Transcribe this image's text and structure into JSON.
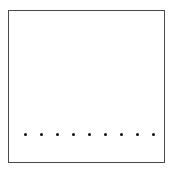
{
  "diagram": {
    "frame": {
      "x": 8,
      "y": 10,
      "width": 157,
      "height": 153,
      "stroke": "#4a4a4a",
      "fill": "#ffffff"
    },
    "dots": {
      "count": 9,
      "color": "#111111",
      "y": 134,
      "x_positions": [
        25,
        41,
        57,
        73,
        89,
        105,
        121,
        137,
        153
      ],
      "diameter": 3
    }
  }
}
